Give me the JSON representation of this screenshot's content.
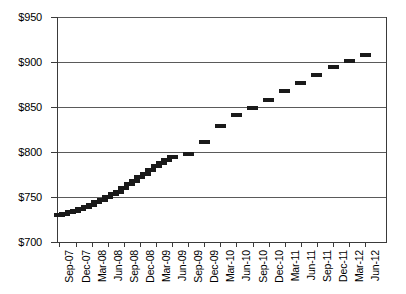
{
  "chart_data": {
    "type": "scatter",
    "title": "",
    "subtitle": "",
    "xlabel": "",
    "ylabel": "",
    "ylim": [
      700,
      950
    ],
    "ytick_values": [
      950,
      900,
      850,
      800,
      750,
      700
    ],
    "ytick_labels": [
      "$950",
      "$900",
      "$850",
      "$800",
      "$750",
      "$700"
    ],
    "grid": true,
    "legend": "none",
    "marker_style": "horizontal-dash",
    "marker_color": "#1a1a1a",
    "xtick_labels": [
      "Sep-07",
      "Dec-07",
      "Mar-08",
      "Jun-08",
      "Sep-08",
      "Dec-08",
      "Mar-09",
      "Jun-09",
      "Sep-09",
      "Dec-09",
      "Mar-10",
      "Jun-10",
      "Sep-10",
      "Dec-10",
      "Mar-11",
      "Jun-11",
      "Sep-11",
      "Dec-11",
      "Mar-12",
      "Jun-12"
    ],
    "x": [
      "Sep-07",
      "Oct-07",
      "Nov-07",
      "Dec-07",
      "Jan-08",
      "Feb-08",
      "Mar-08",
      "Apr-08",
      "May-08",
      "Jun-08",
      "Jul-08",
      "Aug-08",
      "Sep-08",
      "Oct-08",
      "Nov-08",
      "Dec-08",
      "Jan-09",
      "Feb-09",
      "Mar-09",
      "Apr-09",
      "May-09",
      "Jun-09",
      "Sep-09",
      "Dec-09",
      "Mar-10",
      "Jun-10",
      "Sep-10",
      "Dec-10",
      "Mar-11",
      "Jun-11",
      "Sep-11",
      "Dec-11",
      "Mar-12",
      "Jun-12"
    ],
    "values": [
      730,
      731,
      733,
      735,
      737,
      739,
      741,
      744,
      747,
      750,
      753,
      756,
      760,
      764,
      768,
      772,
      776,
      780,
      784,
      788,
      791,
      794,
      798,
      811,
      829,
      841,
      849,
      858,
      868,
      877,
      886,
      894,
      901,
      908
    ]
  },
  "axes": {
    "y_title": "",
    "x_title": ""
  }
}
